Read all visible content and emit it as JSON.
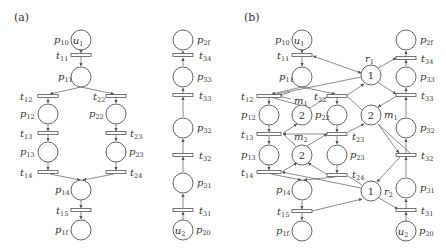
{
  "panels": [
    {
      "id": "a",
      "label": "(a)"
    },
    {
      "id": "b",
      "label": "(b)"
    }
  ],
  "colors": {
    "stroke": "#555555",
    "text": "#333333",
    "background": "#ffffff"
  },
  "places": {
    "p10": {
      "label": "p",
      "sub": "10",
      "token": "u",
      "token_sub": "1"
    },
    "p11": {
      "label": "p",
      "sub": "11"
    },
    "p12": {
      "label": "p",
      "sub": "12"
    },
    "p13": {
      "label": "p",
      "sub": "13"
    },
    "p14": {
      "label": "p",
      "sub": "14"
    },
    "p1f": {
      "label": "p",
      "sub": "1f"
    },
    "p22": {
      "label": "p",
      "sub": "22"
    },
    "p23": {
      "label": "p",
      "sub": "23"
    },
    "p2f": {
      "label": "p",
      "sub": "2f"
    },
    "p33": {
      "label": "p",
      "sub": "33"
    },
    "p32": {
      "label": "p",
      "sub": "32"
    },
    "p31": {
      "label": "p",
      "sub": "31"
    },
    "p20": {
      "label": "p",
      "sub": "20",
      "token": "u",
      "token_sub": "2"
    }
  },
  "transitions": {
    "t11": {
      "label": "t",
      "sub": "11"
    },
    "t12": {
      "label": "t",
      "sub": "12"
    },
    "t13": {
      "label": "t",
      "sub": "13"
    },
    "t14": {
      "label": "t",
      "sub": "14"
    },
    "t15": {
      "label": "t",
      "sub": "15"
    },
    "t22": {
      "label": "t",
      "sub": "22"
    },
    "t23": {
      "label": "t",
      "sub": "23"
    },
    "t24": {
      "label": "t",
      "sub": "24"
    },
    "t34": {
      "label": "t",
      "sub": "34"
    },
    "t33": {
      "label": "t",
      "sub": "33"
    },
    "t32": {
      "label": "t",
      "sub": "32"
    },
    "t31": {
      "label": "t",
      "sub": "31"
    }
  },
  "resources": {
    "r1": {
      "label": "r",
      "sub": "1",
      "tokens": "1"
    },
    "r2": {
      "label": "r",
      "sub": "2",
      "tokens": "1"
    },
    "m1_left": {
      "label": "m",
      "sub": "1",
      "tokens": "2"
    },
    "m1_right": {
      "label": "m",
      "sub": "1",
      "tokens": "2"
    },
    "m2": {
      "label": "m",
      "sub": "2",
      "tokens": "2"
    }
  }
}
